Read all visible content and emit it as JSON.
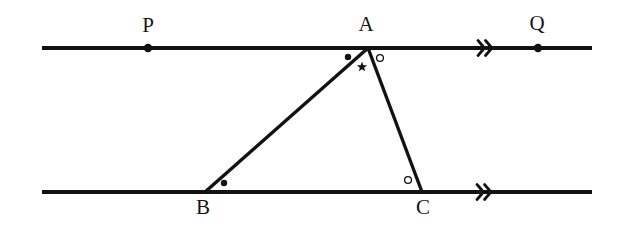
{
  "figure": {
    "type": "euclidean-geometry-diagram",
    "background_color": "#ffffff",
    "ink_color": "#121212",
    "width": 617,
    "height": 228
  },
  "labels": {
    "p": "P",
    "q": "Q",
    "a": "A",
    "b": "B",
    "c": "C"
  },
  "points": {
    "p": {
      "name": "P",
      "x": 148,
      "y": 48,
      "label_x": 148,
      "label_y": 32
    },
    "q": {
      "name": "Q",
      "x": 538,
      "y": 48,
      "label_x": 537,
      "label_y": 30
    },
    "a": {
      "name": "A",
      "x": 368,
      "y": 48,
      "label_x": 366,
      "label_y": 31
    },
    "b": {
      "name": "B",
      "x": 205,
      "y": 192,
      "label_x": 203,
      "label_y": 214
    },
    "c": {
      "name": "C",
      "x": 422,
      "y": 192,
      "label_x": 423,
      "label_y": 214
    }
  },
  "lines": {
    "top": {
      "name": "line-PQ",
      "x1": 42,
      "y1": 48,
      "x2": 592,
      "y2": 48,
      "width": 4.2
    },
    "bottom": {
      "name": "line-BC-extended",
      "x1": 42,
      "y1": 192,
      "x2": 592,
      "y2": 192,
      "width": 4.2
    }
  },
  "triangle": {
    "name": "triangle-ABC",
    "vertices": [
      {
        "label": "A",
        "x": 368,
        "y": 48
      },
      {
        "label": "B",
        "x": 205,
        "y": 192
      },
      {
        "label": "C",
        "x": 422,
        "y": 192
      }
    ],
    "sides": [
      {
        "name": "side-AB",
        "x1": 368,
        "y1": 48,
        "x2": 205,
        "y2": 192
      },
      {
        "name": "side-AC",
        "x1": 368,
        "y1": 48,
        "x2": 422,
        "y2": 192
      }
    ],
    "stroke_width": 3.4
  },
  "parallel_marks": [
    {
      "name": "parallel-mark-top",
      "x": 485,
      "y": 48,
      "chevrons": 2
    },
    {
      "name": "parallel-mark-bottom",
      "x": 484,
      "y": 192,
      "chevrons": 2
    }
  ],
  "angle_marks": [
    {
      "name": "angle-mark-A-left-dot",
      "glyph": "filled-dot",
      "x": 348,
      "y": 57,
      "r": 3.2
    },
    {
      "name": "angle-mark-A-star",
      "glyph": "star",
      "x": 362,
      "y": 67,
      "r": 5.4
    },
    {
      "name": "angle-mark-A-right-circle",
      "glyph": "open-circle",
      "x": 380,
      "y": 58,
      "r": 3.4
    },
    {
      "name": "angle-mark-B-dot",
      "glyph": "filled-dot",
      "x": 224,
      "y": 183,
      "r": 3.2
    },
    {
      "name": "angle-mark-C-circle",
      "glyph": "open-circle",
      "x": 408,
      "y": 180,
      "r": 3.4
    }
  ],
  "point_dots": [
    {
      "name": "point-dot-P",
      "x": 148,
      "y": 48,
      "r": 4.2
    },
    {
      "name": "point-dot-Q",
      "x": 538,
      "y": 48,
      "r": 4.2
    }
  ]
}
